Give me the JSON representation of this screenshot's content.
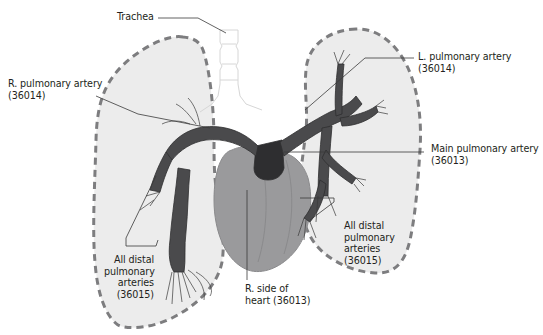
{
  "diagram": {
    "type": "anatomical-illustration",
    "colors": {
      "lung_fill": "#ececec",
      "lung_outline": "#7d7d7f",
      "artery": "#4a4a4c",
      "artery_dark": "#2e2e30",
      "heart": "#9a9a9c",
      "heart_shade": "#8a8a8c",
      "trachea": "#d8d8d8",
      "leader_line": "#3a3a3a",
      "text": "#231f20"
    },
    "labels": {
      "trachea": {
        "line1": "Trachea"
      },
      "r_pulmonary_artery": {
        "line1": "R. pulmonary artery",
        "line2": "(36014)"
      },
      "l_pulmonary_artery": {
        "line1": "L. pulmonary artery",
        "line2": "(36014)"
      },
      "main_pulmonary_artery": {
        "line1": "Main pulmonary artery",
        "line2": "(36013)"
      },
      "r_side_of_heart": {
        "line1": "R. side of",
        "line2": "heart (36013)"
      },
      "distal_left_view": {
        "line1": "All distal",
        "line2": "pulmonary",
        "line3": "arteries",
        "line4": "(36015)"
      },
      "distal_right_view": {
        "line1": "All distal",
        "line2": "pulmonary",
        "line3": "arteries",
        "line4": "(36015)"
      }
    },
    "structures": [
      "right-lung",
      "left-lung",
      "trachea",
      "heart",
      "main-pulmonary-artery",
      "right-pulmonary-artery",
      "left-pulmonary-artery",
      "distal-pulmonary-arteries"
    ]
  }
}
